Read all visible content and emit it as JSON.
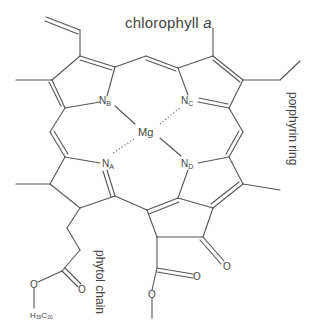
{
  "title": {
    "text": "chlorophyll ",
    "italic_suffix": "a"
  },
  "labels": {
    "porphyrin_ring": "porphyrin ring",
    "phytol_chain": "phytol chain"
  },
  "atoms": {
    "metal": "Mg",
    "nitrogens": [
      {
        "symbol": "N",
        "subscript": "A"
      },
      {
        "symbol": "N",
        "subscript": "B"
      },
      {
        "symbol": "N",
        "subscript": "C"
      },
      {
        "symbol": "N",
        "subscript": "D"
      }
    ],
    "oxygen": "O",
    "phytyl_group": {
      "h": "H",
      "h_count": "39",
      "c": "C",
      "c_count": "20"
    }
  },
  "colors": {
    "line": "#555555",
    "text": "#444444",
    "background": "#ffffff"
  }
}
